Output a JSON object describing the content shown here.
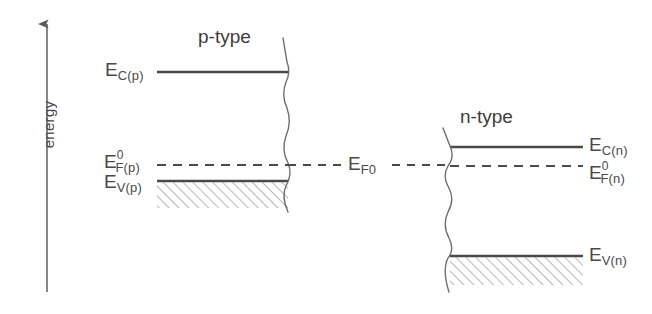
{
  "figure": {
    "type": "energy-band-diagram",
    "background_color": "#ffffff",
    "line_color": "#4a4a4a",
    "hatch_color": "#8f8f8f",
    "text_color": "#4a4a4a"
  },
  "axis": {
    "label": "energy",
    "direction": "up",
    "x": 47,
    "y_top": 20,
    "y_bottom": 292
  },
  "regions": [
    {
      "id": "p-type",
      "title": "p-type",
      "title_x": 240,
      "title_y": 38,
      "levels": [
        {
          "id": "ec-p",
          "base": "E",
          "subscript": "C(p)",
          "superscript": "",
          "style": "solid",
          "y": 72,
          "x_start": 157,
          "x_end": 288,
          "label_x": 105,
          "label_y": 62,
          "label_side": "left"
        },
        {
          "id": "ef0-p",
          "base": "E",
          "subscript": "F(p)",
          "superscript": "0",
          "style": "dashed",
          "y": 165,
          "x_start": 157,
          "x_end": 288,
          "label_x": 104,
          "label_y": 154,
          "label_side": "left"
        },
        {
          "id": "ev-p",
          "base": "E",
          "subscript": "V(p)",
          "superscript": "",
          "style": "solid",
          "y": 181,
          "x_start": 157,
          "x_end": 288,
          "label_x": 104,
          "label_y": 176,
          "label_side": "left"
        }
      ],
      "hatched_band": {
        "x": 157,
        "y": 182,
        "width": 131,
        "height": 26
      },
      "break_line_x": 288,
      "break_line_y_top": 38,
      "break_line_y_bottom": 212
    },
    {
      "id": "n-type",
      "title": "n-type",
      "title_x": 500,
      "title_y": 118,
      "levels": [
        {
          "id": "ec-n",
          "base": "E",
          "subscript": "C(n)",
          "superscript": "",
          "style": "solid",
          "y": 147,
          "x_start": 450,
          "x_end": 583,
          "label_x": 588,
          "label_y": 139,
          "label_side": "right"
        },
        {
          "id": "ef0-n",
          "base": "E",
          "subscript": "F(n)",
          "superscript": "0",
          "style": "dashed",
          "y": 166,
          "x_start": 450,
          "x_end": 583,
          "label_x": 588,
          "label_y": 165,
          "label_side": "right"
        },
        {
          "id": "ev-n",
          "base": "E",
          "subscript": "V(n)",
          "superscript": "",
          "style": "solid",
          "y": 256,
          "x_start": 450,
          "x_end": 583,
          "label_x": 588,
          "label_y": 248,
          "label_side": "right"
        }
      ],
      "hatched_band": {
        "x": 450,
        "y": 257,
        "width": 133,
        "height": 28
      },
      "break_line_x": 450,
      "break_line_y_top": 128,
      "break_line_y_bottom": 292
    }
  ],
  "common_fermi": {
    "base": "E",
    "subscript": "F0",
    "label": "E_F0",
    "label_x": 348,
    "label_y": 155,
    "y": 165,
    "dash_segments": [
      {
        "x_start": 288,
        "x_end": 344
      },
      {
        "x_start": 392,
        "x_end": 452
      }
    ],
    "style": "dashed"
  }
}
